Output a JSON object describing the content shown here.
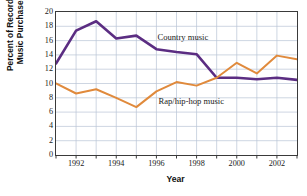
{
  "chart_data": {
    "type": "line",
    "title": "",
    "xlabel": "Year",
    "ylabel": "Percent of Recorded Music Purchases",
    "ylabel_line1": "Percent of Recorded",
    "ylabel_line2": "Music Purchases",
    "x": [
      1991,
      1992,
      1993,
      1994,
      1995,
      1996,
      1997,
      1998,
      1999,
      2000,
      2001,
      2002,
      2003
    ],
    "xlim": [
      1991,
      2003
    ],
    "ylim": [
      0,
      20
    ],
    "ytick_values": [
      0,
      2,
      4,
      6,
      8,
      10,
      12,
      14,
      16,
      18,
      20
    ],
    "ytick_labels": [
      "0",
      "2",
      "4",
      "6",
      "8",
      "10",
      "12",
      "14",
      "16",
      "18",
      "20"
    ],
    "xtick_values": [
      1992,
      1994,
      1996,
      1998,
      2000,
      2002
    ],
    "xtick_labels": [
      "1992",
      "1994",
      "1996",
      "1998",
      "2000",
      "2002"
    ],
    "xtick_minor_values": [
      1991,
      1993,
      1995,
      1997,
      1999,
      2001,
      2003
    ],
    "grid": true,
    "grid_color": "#b9c4d6",
    "axis_color": "#3a3a3a",
    "legend_position": "inline-annotation",
    "series": [
      {
        "name": "Country music",
        "label": "Country music",
        "color": "#5B2D82",
        "label_x": 1996.05,
        "label_y": 16.35,
        "values": [
          12.8,
          17.4,
          18.7,
          16.3,
          16.7,
          14.8,
          14.4,
          14.1,
          10.8,
          10.8,
          10.6,
          10.8,
          10.5
        ]
      },
      {
        "name": "Rap/hip-hop music",
        "label": "Rap/hip-hop music",
        "color": "#E08A3C",
        "label_x": 1996.1,
        "label_y": 7.35,
        "values": [
          10.0,
          8.6,
          9.2,
          8.0,
          6.7,
          8.9,
          10.2,
          9.7,
          10.8,
          12.9,
          11.4,
          13.9,
          13.4
        ]
      }
    ]
  }
}
